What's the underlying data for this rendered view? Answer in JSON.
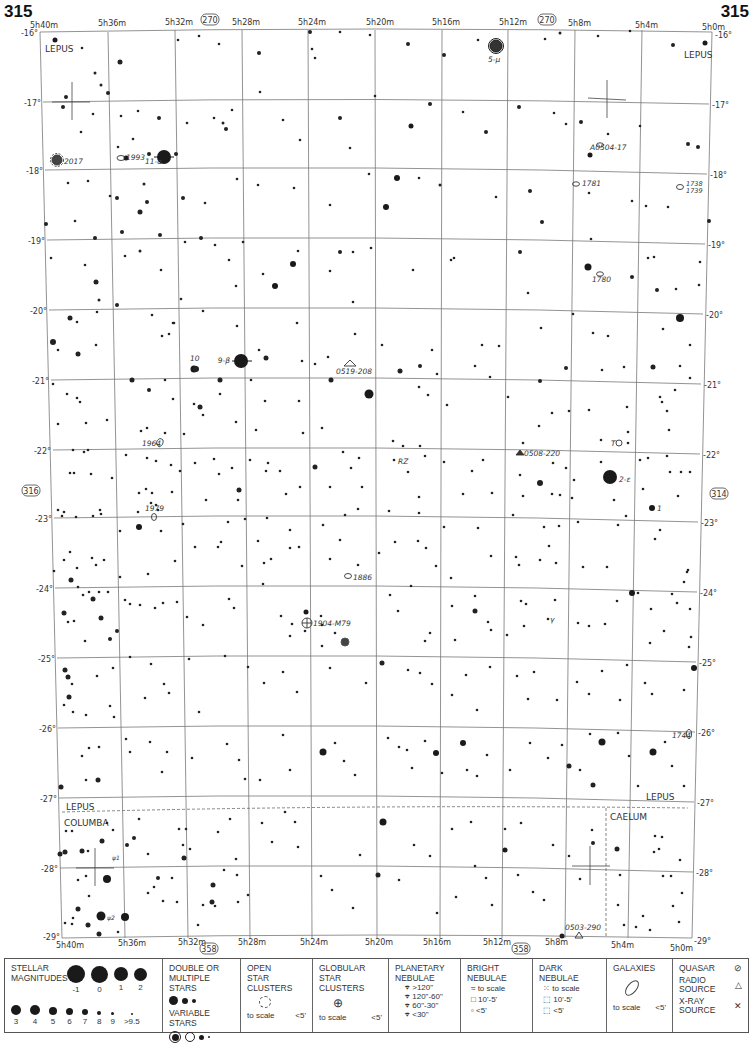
{
  "page": {
    "number": "315",
    "top_ref": "270",
    "bottom_ref": "358",
    "left_ref": "316",
    "right_ref": "314"
  },
  "axes": {
    "ra_labels": [
      "5h40m",
      "5h36m",
      "5h32m",
      "5h28m",
      "5h24m",
      "5h20m",
      "5h16m",
      "5h12m",
      "5h8m",
      "5h4m",
      "5h0m"
    ],
    "dec_labels": [
      "-16°",
      "-17°",
      "-18°",
      "-19°",
      "-20°",
      "-21°",
      "-22°",
      "-23°",
      "-24°",
      "-25°",
      "-26°",
      "-27°",
      "-28°",
      "-29°"
    ]
  },
  "constellations": {
    "lepus_top_left": "LEPUS",
    "lepus_top_right": "LEPUS",
    "lepus_bottom_left": "LEPUS",
    "columba": "COLUMBA",
    "lepus_bottom_right": "LEPUS",
    "caelum": "CAELUM"
  },
  "objects": {
    "mu": "5-μ",
    "alpha": "11-α",
    "beta": "9-β",
    "epsilon": "2-ε",
    "star_10": "10",
    "star_1": "1",
    "T": "T",
    "RZ": "RZ",
    "gamma": "γ",
    "psi1": "ψ1",
    "psi2": "ψ2",
    "ngc2017": "2017",
    "ngc1993": "1993",
    "ngc1781": "1781",
    "ngc1738_1739": [
      "1738",
      "1739"
    ],
    "ngc1780": "1780",
    "ngc1964": "1964",
    "ngc1979": "1979",
    "ngc1886": "1886",
    "m79": "1904-M79",
    "ngc1744": "1744",
    "x_a0504": "A0504-17",
    "radio_0519": "0519-208",
    "radio_0508": "0508-220",
    "radio_0503": "0503-290"
  },
  "legend": {
    "magnitudes": {
      "title": [
        "STELLAR",
        "MAGNITUDES"
      ],
      "bright": [
        "-1",
        "0",
        "1",
        "2"
      ],
      "faint": [
        "3",
        "4",
        "5",
        "6",
        "7",
        "8",
        "9",
        ">9.5"
      ]
    },
    "double": {
      "title": [
        "DOUBLE OR",
        "MULTIPLE STARS"
      ]
    },
    "variable": {
      "title": "VARIABLE STARS"
    },
    "open_clusters": {
      "title": [
        "OPEN",
        "STAR CLUSTERS"
      ],
      "to_scale": "to scale",
      "small": "<5'"
    },
    "globular": {
      "title": [
        "GLOBULAR",
        "STAR CLUSTERS"
      ],
      "to_scale": "to scale",
      "small": "<5'"
    },
    "planetary": {
      "title": [
        "PLANETARY",
        "NEBULAE"
      ],
      "sizes": [
        ">120\"",
        "120\"-60\"",
        "60\"-30\"",
        "<30\""
      ]
    },
    "bright_neb": {
      "title": [
        "BRIGHT",
        "NEBULAE"
      ],
      "sizes": [
        "to scale",
        "10'-5'",
        "<5'"
      ]
    },
    "dark_neb": {
      "title": [
        "DARK",
        "NEBULAE"
      ],
      "sizes": [
        "to scale",
        "10'-5'",
        "<5'"
      ]
    },
    "galaxies": {
      "title": "GALAXIES",
      "to_scale": "to scale",
      "small": "<5'"
    },
    "quasar": "QUASAR",
    "radio": [
      "RADIO",
      "SOURCE"
    ],
    "xray": [
      "X-RAY",
      "SOURCE"
    ]
  }
}
